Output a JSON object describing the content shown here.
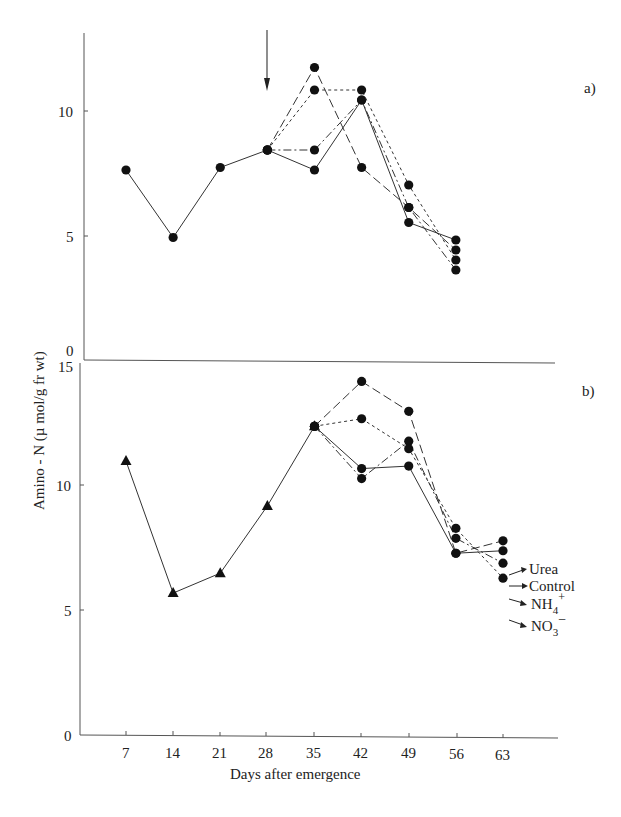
{
  "chart_data": [
    {
      "type": "line",
      "panel": "a)",
      "title": "",
      "xlabel": "Days after emergence",
      "ylabel": "Amino - N (µ mol/g fr wt)",
      "ylim": [
        0,
        12.5
      ],
      "yticks": [
        0,
        5,
        10
      ],
      "xticks": [
        7,
        14,
        21,
        28,
        35,
        42,
        49,
        56,
        63
      ],
      "grid": false,
      "annotation": {
        "type": "arrow",
        "x": 28,
        "direction": "down"
      },
      "series": [
        {
          "name": "Control",
          "marker": "circle",
          "style": "solid",
          "x": [
            7,
            14,
            21,
            28,
            35,
            42,
            49,
            56
          ],
          "values": [
            7.6,
            4.9,
            7.7,
            8.4,
            7.6,
            10.4,
            5.5,
            4.8
          ]
        },
        {
          "name": "Urea",
          "marker": "circle",
          "style": "long-dash",
          "x": [
            28,
            35,
            42,
            49,
            56
          ],
          "values": [
            8.4,
            11.7,
            7.7,
            6.1,
            4.4
          ]
        },
        {
          "name": "NH4+",
          "marker": "circle",
          "style": "dash-dot",
          "x": [
            28,
            35,
            42,
            49,
            56
          ],
          "values": [
            8.4,
            8.4,
            10.4,
            6.1,
            3.6
          ]
        },
        {
          "name": "NO3-",
          "marker": "circle",
          "style": "short-dash",
          "x": [
            28,
            35,
            42,
            49,
            56
          ],
          "values": [
            8.4,
            10.8,
            10.8,
            7.0,
            4.0
          ]
        }
      ]
    },
    {
      "type": "line",
      "panel": "b)",
      "title": "",
      "xlabel": "Days after emergence",
      "ylabel": "Amino - N (µ mol/g fr wt)",
      "ylim": [
        0,
        15
      ],
      "yticks": [
        0,
        5,
        10,
        15
      ],
      "xticks": [
        7,
        14,
        21,
        28,
        35,
        42,
        49,
        56,
        63
      ],
      "grid": false,
      "legend_position": "right, at end of lines",
      "series": [
        {
          "name": "Baseline",
          "marker": "triangle",
          "style": "solid",
          "x": [
            7,
            14,
            21,
            28,
            35
          ],
          "values": [
            11.0,
            5.7,
            6.5,
            9.2,
            12.4
          ]
        },
        {
          "name": "Urea",
          "marker": "circle",
          "style": "long-dash",
          "x": [
            35,
            42,
            49,
            56,
            63
          ],
          "values": [
            12.4,
            14.2,
            13.0,
            7.3,
            7.8
          ]
        },
        {
          "name": "Control",
          "marker": "circle",
          "style": "solid",
          "x": [
            35,
            42,
            49,
            56,
            63
          ],
          "values": [
            12.4,
            10.7,
            10.8,
            7.3,
            7.4
          ]
        },
        {
          "name": "NH4+",
          "marker": "circle",
          "style": "dash-dot",
          "x": [
            35,
            42,
            49,
            56,
            63
          ],
          "values": [
            12.4,
            10.3,
            11.8,
            7.9,
            6.9
          ]
        },
        {
          "name": "NO3-",
          "marker": "circle",
          "style": "short-dash",
          "x": [
            35,
            42,
            49,
            56,
            63
          ],
          "values": [
            12.4,
            12.7,
            11.5,
            8.3,
            6.3
          ]
        }
      ]
    }
  ],
  "labels": {
    "panel_a": "a)",
    "panel_b": "b)",
    "xlabel": "Days after emergence",
    "ylabel": "Amino - N (µ mol/g fr wt)",
    "legend": {
      "urea": "Urea",
      "control": "Control",
      "nh4": "NH",
      "nh4_sub": "4",
      "nh4_sup": "+",
      "no3": "NO",
      "no3_sub": "3",
      "no3_sup": "−"
    },
    "yticks_a": [
      "10",
      "5",
      "0"
    ],
    "yticks_b": [
      "15",
      "10",
      "5",
      "0"
    ],
    "xticks": [
      "7",
      "14",
      "21",
      "28",
      "35",
      "42",
      "49",
      "56",
      "63"
    ]
  }
}
